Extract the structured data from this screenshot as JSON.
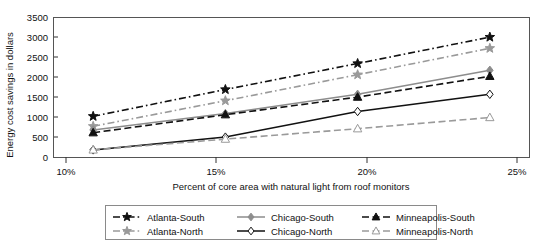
{
  "chart_data": {
    "type": "line",
    "title": "",
    "xlabel": "Percent of core area with natural light from roof monitors",
    "ylabel": "Energy cost savings in dollars",
    "categories": [
      "10%",
      "15%",
      "20%",
      "25%"
    ],
    "x": [
      10,
      15,
      20,
      25
    ],
    "xlim": [
      8.5,
      26.5
    ],
    "ylim": [
      0,
      3500
    ],
    "yticks": [
      0,
      500,
      1000,
      1500,
      2000,
      2500,
      3000,
      3500
    ],
    "ytick_labels": [
      "0",
      "500",
      "1000",
      "1500",
      "2000",
      "2500",
      "3000",
      "3500"
    ],
    "grid": false,
    "legend_position": "bottom",
    "series": [
      {
        "name": "Atlanta-South",
        "values": [
          1030,
          1700,
          2350,
          3010
        ],
        "color": "#111111",
        "line_style": "dash-dot",
        "marker": "star",
        "marker_fill": "filled"
      },
      {
        "name": "Atlanta-North",
        "values": [
          780,
          1420,
          2070,
          2730
        ],
        "color": "#9a9a9a",
        "line_style": "dash-dot",
        "marker": "star",
        "marker_fill": "filled"
      },
      {
        "name": "Chicago-South",
        "values": [
          690,
          1100,
          1580,
          2180
        ],
        "color": "#8d8d8d",
        "line_style": "solid",
        "marker": "diamond",
        "marker_fill": "filled"
      },
      {
        "name": "Chicago-North",
        "values": [
          190,
          510,
          1150,
          1580
        ],
        "color": "#111111",
        "line_style": "solid",
        "marker": "diamond",
        "marker_fill": "hollow"
      },
      {
        "name": "Minneapolis-South",
        "values": [
          620,
          1070,
          1510,
          2030
        ],
        "color": "#111111",
        "line_style": "dashed",
        "marker": "triangle",
        "marker_fill": "filled"
      },
      {
        "name": "Minneapolis-North",
        "values": [
          190,
          460,
          720,
          1000
        ],
        "color": "#9a9a9a",
        "line_style": "dashed",
        "marker": "triangle",
        "marker_fill": "hollow"
      }
    ],
    "legend_entries": [
      "Atlanta-South",
      "Atlanta-North",
      "Chicago-South",
      "Chicago-North",
      "Minneapolis-South",
      "Minneapolis-North"
    ]
  }
}
